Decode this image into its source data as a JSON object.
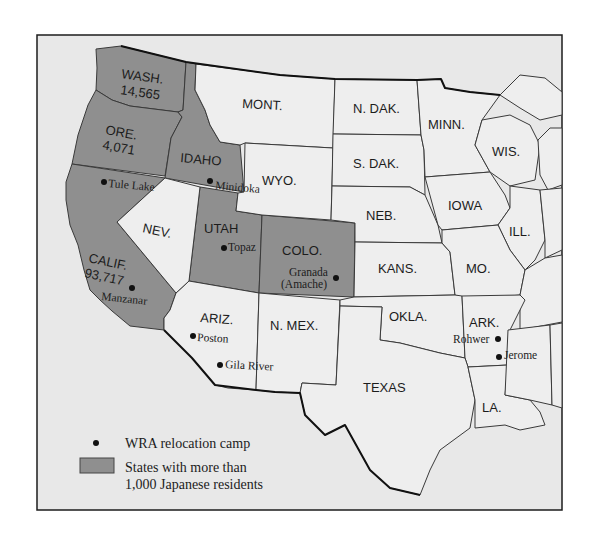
{
  "map": {
    "type": "thematic-map",
    "region": "Western and Central United States",
    "colors": {
      "highlighted_state": "#8f8f8f",
      "other_state": "#eeeeee",
      "background": "#e8e8e8",
      "border": "#1c1c1c"
    },
    "highlighted_states": [
      {
        "label": "WASH.",
        "population": "14,565"
      },
      {
        "label": "ORE.",
        "population": "4,071"
      },
      {
        "label": "IDAHO",
        "population": ""
      },
      {
        "label": "CALIF.",
        "population": "93,717"
      },
      {
        "label": "UTAH",
        "population": ""
      },
      {
        "label": "COLO.",
        "population": ""
      }
    ],
    "states": {
      "wash": "WASH.",
      "wash_pop": "14,565",
      "ore": "ORE.",
      "ore_pop": "4,071",
      "idaho": "IDAHO",
      "mont": "MONT.",
      "wyo": "WYO.",
      "ndak": "N. DAK.",
      "sdak": "S. DAK.",
      "minn": "MINN.",
      "wis": "WIS.",
      "iowa": "IOWA",
      "neb": "NEB.",
      "ill": "ILL.",
      "nev": "NEV.",
      "utah": "UTAH",
      "colo": "COLO.",
      "calif": "CALIF.",
      "calif_pop": "93,717",
      "kans": "KANS.",
      "mo": "MO.",
      "ariz": "ARIZ.",
      "nmex": "N. MEX.",
      "okla": "OKLA.",
      "ark": "ARK.",
      "texas": "TEXAS",
      "la": "LA."
    },
    "camps": [
      {
        "name": "Tule Lake",
        "state": "CALIF."
      },
      {
        "name": "Minidoka",
        "state": "IDAHO"
      },
      {
        "name": "Topaz",
        "state": "UTAH"
      },
      {
        "name": "Manzanar",
        "state": "CALIF."
      },
      {
        "name": "Granada",
        "alt_name": "(Amache)",
        "state": "COLO."
      },
      {
        "name": "Poston",
        "state": "ARIZ."
      },
      {
        "name": "Gila River",
        "state": "ARIZ."
      },
      {
        "name": "Rohwer",
        "state": "ARK."
      },
      {
        "name": "Jerome",
        "state": "ARK."
      }
    ],
    "legend": {
      "camp_label": "WRA relocation camp",
      "state_label_line1": "States with more than",
      "state_label_line2": "1,000 Japanese residents"
    }
  }
}
